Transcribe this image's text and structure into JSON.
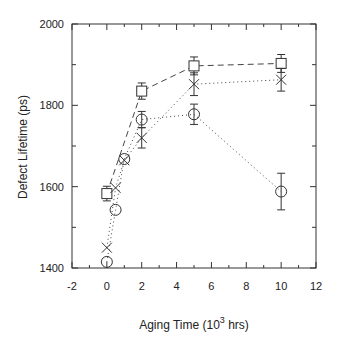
{
  "chart_data": {
    "type": "line",
    "title": "",
    "xlabel": "Aging Time (10^3 hrs)",
    "xlabel_parts": {
      "prefix": "Aging Time (10",
      "sup": "3",
      "suffix": " hrs)"
    },
    "ylabel": "Defect Lifetime (ps)",
    "xlim": [
      -2,
      12
    ],
    "ylim": [
      1400,
      2000
    ],
    "x_ticks": [
      -2,
      0,
      2,
      4,
      6,
      8,
      10,
      12
    ],
    "y_ticks": [
      1400,
      1600,
      1800,
      2000
    ],
    "grid": false,
    "legend": null,
    "series": [
      {
        "name": "square",
        "marker": "square",
        "line": "dashed",
        "points": [
          {
            "x": 0,
            "y": 1583,
            "err": 18
          },
          {
            "x": 2,
            "y": 1835,
            "err": 20
          },
          {
            "x": 5,
            "y": 1897,
            "err": 22
          },
          {
            "x": 10,
            "y": 1903,
            "err": 22
          }
        ]
      },
      {
        "name": "cross",
        "marker": "x",
        "line": "dotted",
        "points": [
          {
            "x": 0,
            "y": 1450,
            "err": 0
          },
          {
            "x": 0.5,
            "y": 1597,
            "err": 0
          },
          {
            "x": 1,
            "y": 1665,
            "err": 0
          },
          {
            "x": 2,
            "y": 1720,
            "err": 25
          },
          {
            "x": 5,
            "y": 1852,
            "err": 28
          },
          {
            "x": 10,
            "y": 1863,
            "err": 28
          }
        ]
      },
      {
        "name": "circle",
        "marker": "circle",
        "line": "dotted",
        "points": [
          {
            "x": 0,
            "y": 1415,
            "err": 0
          },
          {
            "x": 0.5,
            "y": 1543,
            "err": 0
          },
          {
            "x": 1,
            "y": 1668,
            "err": 0
          },
          {
            "x": 2,
            "y": 1765,
            "err": 20
          },
          {
            "x": 5,
            "y": 1778,
            "err": 25
          },
          {
            "x": 10,
            "y": 1588,
            "err": 45
          }
        ]
      }
    ]
  }
}
